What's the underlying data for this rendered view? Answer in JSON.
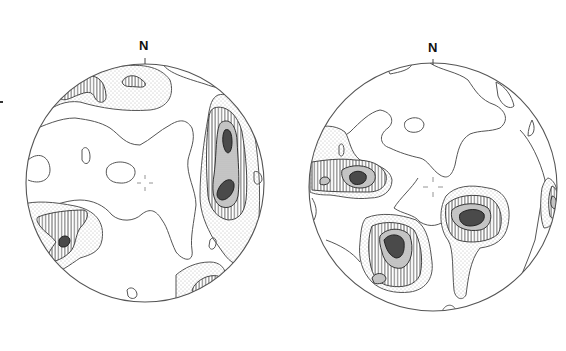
{
  "figure": {
    "type": "stereonet pole-density contour diagrams",
    "panels": [
      {
        "id": "left",
        "north_label": "N",
        "center": [
          145,
          183
        ],
        "radius": 119,
        "maxima": [
          {
            "location": "east, upper",
            "level": 5
          },
          {
            "location": "east, lower",
            "level": 5
          },
          {
            "location": "southwest",
            "level": 5
          },
          {
            "location": "northwest rim",
            "level": 5
          }
        ]
      },
      {
        "id": "right",
        "north_label": "N",
        "center": [
          433,
          187
        ],
        "radius": 124,
        "maxima": [
          {
            "location": "west",
            "level": 5
          },
          {
            "location": "south-southwest",
            "level": 5
          },
          {
            "location": "east-southeast",
            "level": 5
          },
          {
            "location": "east rim",
            "level": 4
          }
        ]
      }
    ],
    "legend_levels": [
      {
        "level": 1,
        "fill": "blank"
      },
      {
        "level": 2,
        "fill": "stipple"
      },
      {
        "level": 3,
        "fill": "vertical hatch"
      },
      {
        "level": 4,
        "fill": "fine gray stipple"
      },
      {
        "level": 5,
        "fill": "dark gray"
      }
    ],
    "colors": {
      "line": "#555555",
      "dark_fill": "#4a4a4a",
      "background": "#ffffff"
    }
  }
}
